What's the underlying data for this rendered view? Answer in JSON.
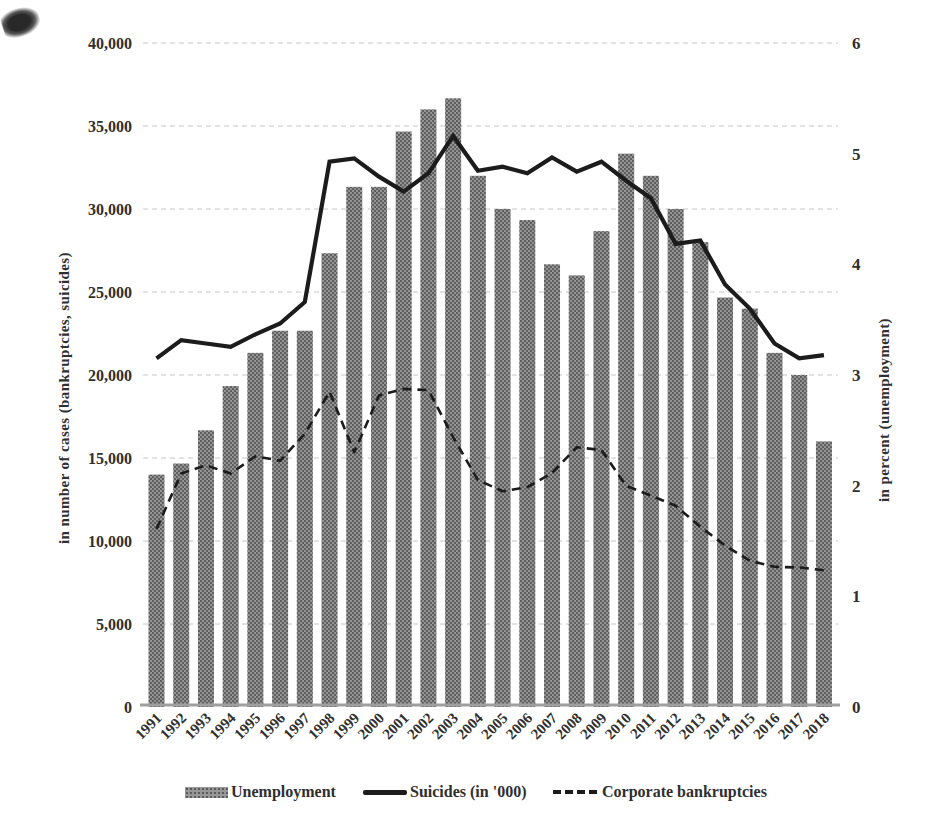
{
  "chart_data": {
    "type": "bar",
    "subtype": "combo-bar-line",
    "years": [
      "1991",
      "1992",
      "1993",
      "1994",
      "1995",
      "1996",
      "1997",
      "1998",
      "1999",
      "2000",
      "2001",
      "2002",
      "2003",
      "2004",
      "2005",
      "2006",
      "2007",
      "2008",
      "2009",
      "2010",
      "2011",
      "2012",
      "2013",
      "2014",
      "2015",
      "2016",
      "2017",
      "2018"
    ],
    "series": [
      {
        "name": "Unemployment",
        "type": "bar",
        "axis": "right",
        "unit": "percent",
        "values": [
          2.1,
          2.2,
          2.5,
          2.9,
          3.2,
          3.4,
          3.4,
          4.1,
          4.7,
          4.7,
          5.2,
          5.4,
          5.5,
          4.8,
          4.5,
          4.4,
          4.0,
          3.9,
          4.3,
          5.0,
          4.8,
          4.5,
          4.2,
          3.7,
          3.6,
          3.2,
          3.0,
          2.4
        ]
      },
      {
        "name": "Suicides (in '000)",
        "type": "line",
        "style": "solid",
        "axis": "left",
        "unit": "cases",
        "values": [
          21000,
          22100,
          21900,
          21700,
          22450,
          23100,
          24400,
          32850,
          33050,
          31950,
          31050,
          32150,
          34400,
          32300,
          32550,
          32150,
          33100,
          32250,
          32850,
          31700,
          30650,
          27900,
          28100,
          25450,
          24000,
          21900,
          21000,
          21200
        ]
      },
      {
        "name": "Corporate bankruptcies",
        "type": "line",
        "style": "dashed",
        "axis": "left",
        "unit": "cases",
        "values": [
          10723,
          14069,
          14564,
          14061,
          15108,
          14834,
          16464,
          18988,
          15352,
          18769,
          19164,
          19087,
          16255,
          13679,
          12998,
          13245,
          14091,
          15646,
          15480,
          13321,
          12734,
          12124,
          10855,
          9731,
          8812,
          8446,
          8405,
          8235
        ]
      }
    ],
    "left_axis": {
      "label": "in number of cases (bankruptcies, suicides)",
      "min": 0,
      "max": 40000,
      "tick_step": 5000,
      "tick_labels": [
        "0",
        "5,000",
        "10,000",
        "15,000",
        "20,000",
        "25,000",
        "30,000",
        "35,000",
        "40,000"
      ]
    },
    "right_axis": {
      "label": "in percent (unemployment)",
      "min": 0,
      "max": 6,
      "tick_step": 1,
      "tick_labels": [
        "0",
        "1",
        "2",
        "3",
        "4",
        "5",
        "6"
      ]
    },
    "grid": "horizontal dotted gridlines at every 5,000",
    "legend_position": "bottom",
    "title": ""
  },
  "legend": {
    "unemployment": "Unemployment",
    "suicides": "Suicides (in '000)",
    "bankruptcies": "Corporate bankruptcies"
  },
  "colors": {
    "bar_base": "#979797",
    "bar_dot": "#5c5c5c",
    "line": "#1c1c1c",
    "grid": "#c6c6c6",
    "baseline": "#9f9f9f",
    "text": "#2f2f2f",
    "background": "#ffffff"
  }
}
